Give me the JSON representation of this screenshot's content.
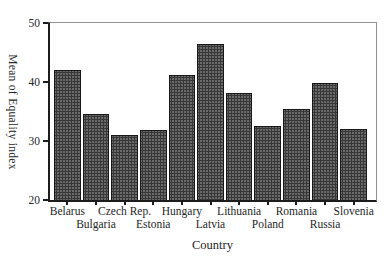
{
  "chart_data": {
    "type": "bar",
    "title": "",
    "categories": [
      "Belarus",
      "Bulgaria",
      "Czech Rep.",
      "Estonia",
      "Hungary",
      "Latvia",
      "Lithuania",
      "Poland",
      "Romania",
      "Russia",
      "Slovenia"
    ],
    "values": [
      42.0,
      34.5,
      31.1,
      31.9,
      41.2,
      46.4,
      38.1,
      32.6,
      35.5,
      39.9,
      32.0
    ],
    "xlabel": "Country",
    "ylabel": "Mean of Equality index",
    "ylim": [
      20,
      50
    ],
    "yticks": [
      50,
      40,
      30,
      20
    ],
    "grid": false,
    "legend_position": "none",
    "bar_fill_color": "#5d5d5d",
    "bar_border_color": "#181818",
    "axis_color": "#1c1c1c",
    "frame_color": "#919191",
    "background_color": "#ffffff",
    "label_layout": "staggered-two-rows"
  }
}
